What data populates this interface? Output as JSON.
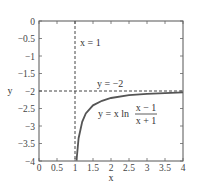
{
  "chart_data": {
    "type": "line",
    "title": "",
    "xlabel": "x",
    "ylabel": "y",
    "xlim": [
      0,
      4
    ],
    "ylim": [
      -4,
      0
    ],
    "grid": false,
    "x_ticks": [
      "0",
      "0.5",
      "1",
      "1.5",
      "2",
      "2.5",
      "3",
      "3.5",
      "4"
    ],
    "y_ticks": [
      "0",
      "−0.5",
      "−1",
      "−1.5",
      "−2",
      "−2.5",
      "−3",
      "−3.5",
      "−4"
    ],
    "series": [
      {
        "name": "y = x ln((x − 1)/(x + 1))",
        "style": "solid",
        "x": [
          1.045,
          1.05,
          1.1,
          1.2,
          1.3,
          1.5,
          1.75,
          2.0,
          2.5,
          3.0,
          3.5,
          4.0
        ],
        "y": [
          -3.99,
          -3.9,
          -3.35,
          -2.88,
          -2.64,
          -2.41,
          -2.28,
          -2.2,
          -2.12,
          -2.08,
          -2.06,
          -2.04
        ]
      }
    ],
    "asymptotes": [
      {
        "type": "vertical",
        "value": 1,
        "label": "x = 1",
        "style": "dashed"
      },
      {
        "type": "horizontal",
        "value": -2,
        "label": "y = −2",
        "style": "dashed"
      }
    ],
    "annotations": [
      {
        "text": "x = 1",
        "x": 1.1,
        "y": -0.55
      },
      {
        "text": "y = −2",
        "x": 2.15,
        "y": -1.85
      },
      {
        "text_main": "y = x ln",
        "numerator": "x − 1",
        "denominator": "x + 1",
        "x": 2.0,
        "y": -2.6
      }
    ]
  }
}
